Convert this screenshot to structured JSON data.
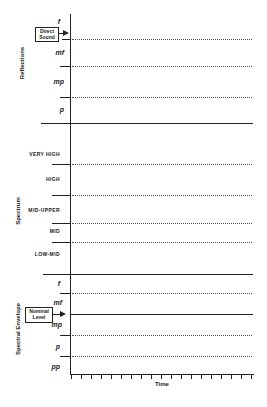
{
  "sections": {
    "reflections": {
      "label": "Reflections",
      "dynamics": [
        "f",
        "mf",
        "mp",
        "p"
      ],
      "annotation": {
        "line1": "Direct",
        "line2": "Sound"
      }
    },
    "spectrum": {
      "label": "Spectrum",
      "bands": [
        "VERY HIGH",
        "HIGH",
        "MID-UPPER",
        "MID",
        "LOW-MID"
      ]
    },
    "spectral_envelope": {
      "label": "Spectral  Envelope",
      "dynamics": [
        "f",
        "mf",
        "mp",
        "p",
        "pp"
      ],
      "annotation": {
        "line1": "Nominal",
        "line2": "Level"
      }
    }
  },
  "x_axis": {
    "label": "Time",
    "tick_count": 19
  }
}
